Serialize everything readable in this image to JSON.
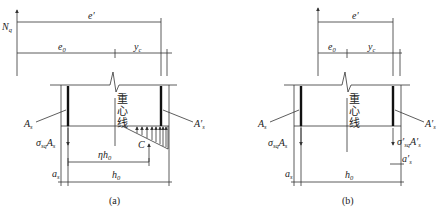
{
  "figures": [
    {
      "id": "a",
      "caption": "(a)",
      "labels": {
        "force": "N",
        "force_sub": "q",
        "e_prime": "e′",
        "e0": "e",
        "e0_sub": "0",
        "yc": "y",
        "yc_sub": "c",
        "centroid_line": [
          "重",
          "心",
          "线"
        ],
        "As": "A",
        "As_sub": "s",
        "As_prime": "A′",
        "As_prime_sub": "s",
        "stress_force": "σ",
        "stress_force_sub": "sq",
        "stress_force_tail": "A",
        "stress_force_tail_sub": "s",
        "compression": "C",
        "eta_h0": "ηh",
        "eta_h0_sub": "0",
        "as": "a",
        "as_sub": "s",
        "h0": "h",
        "h0_sub": "0"
      }
    },
    {
      "id": "b",
      "caption": "(b)",
      "labels": {
        "e_prime": "e′",
        "e0": "e",
        "e0_sub": "0",
        "yc": "y",
        "yc_sub": "c",
        "centroid_line": [
          "重",
          "心",
          "线"
        ],
        "As": "A",
        "As_sub": "s",
        "As_prime": "A′",
        "As_prime_sub": "s",
        "stress_force": "σ",
        "stress_force_sub": "sq",
        "stress_force_tail": "A",
        "stress_force_tail_sub": "s",
        "stress_force_prime": "σ′",
        "stress_force_prime_sub": "sq",
        "stress_force_prime_tail": "A′",
        "stress_force_prime_tail_sub": "s",
        "as_prime": "a′",
        "as_prime_sub": "s",
        "as": "a",
        "as_sub": "s",
        "h0": "h",
        "h0_sub": "0"
      }
    }
  ]
}
